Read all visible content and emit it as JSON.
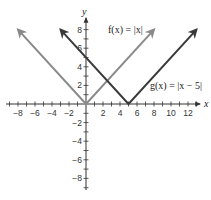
{
  "chart_data": {
    "type": "line",
    "title": "",
    "xlabel": "x",
    "ylabel": "y",
    "xlim": [
      -9,
      13
    ],
    "ylim": [
      -9,
      9
    ],
    "grid": false,
    "legend_position": "inline annotations",
    "x_ticks": [
      -8,
      -6,
      -4,
      -2,
      2,
      4,
      6,
      8,
      10,
      12
    ],
    "x_tick_labels": [
      "−8",
      "−6",
      "−4",
      "−2",
      "2",
      "4",
      "6",
      "8",
      "10",
      "12"
    ],
    "y_ticks": [
      8,
      6,
      4,
      2,
      -2,
      -4,
      -6,
      -8
    ],
    "y_tick_labels": [
      "8",
      "6",
      "4",
      "2",
      "−2",
      "−4",
      "−6",
      "−8"
    ],
    "series": [
      {
        "name": "f(x) = |x|",
        "label": "f(x) = |x|",
        "color": "#8a8a8a",
        "x": [
          -8,
          0,
          8
        ],
        "y": [
          8,
          0,
          8
        ],
        "vertex": [
          0,
          0
        ],
        "arrows": "both ends"
      },
      {
        "name": "g(x) = |x − 5|",
        "label": "g(x) = |x − 5|",
        "color": "#3a3a3a",
        "x": [
          -3,
          5,
          13
        ],
        "y": [
          8,
          0,
          8
        ],
        "vertex": [
          5,
          0
        ],
        "arrows": "both ends"
      }
    ],
    "annotations": [
      {
        "text": "f(x) = |x|",
        "near": [
          4.5,
          8
        ]
      },
      {
        "text": "g(x) = |x − 5|",
        "near": [
          10,
          2
        ]
      }
    ]
  },
  "axes": {
    "x_name": "x",
    "y_name": "y"
  },
  "colors": {
    "f_line": "#8a8a8a",
    "g_line": "#3a3a3a",
    "axis": "#333333"
  }
}
